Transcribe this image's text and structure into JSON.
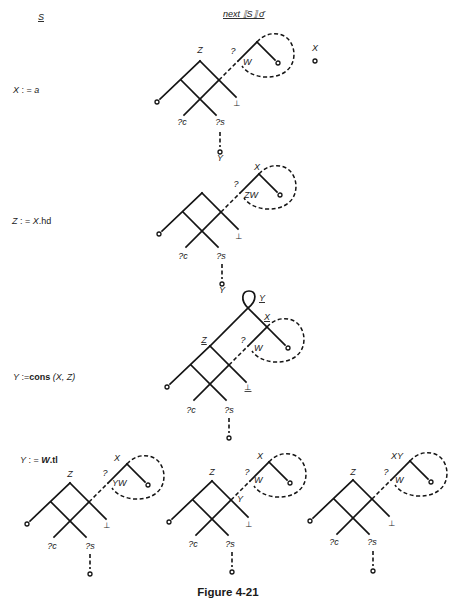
{
  "header": {
    "statement_heading": "S",
    "semantics_heading": "next ⟦S⟧ σ̄"
  },
  "statements": [
    {
      "lhs": "X",
      "assign": " : = ",
      "rhs": "a"
    },
    {
      "lhs": "Z",
      "assign": " : = ",
      "obj": "X",
      "field": ".hd"
    },
    {
      "lhs": "Y",
      "assign": " :=",
      "fn": "cons",
      "args": "  (X, Z)"
    },
    {
      "lhs": "Y",
      "assign": " : = ",
      "obj": "W",
      "field": ".tl"
    }
  ],
  "diagrams": [
    {
      "apex": "Z",
      "question": "?",
      "loop_entry": "W",
      "bottom": "⊥",
      "sel_c": "?c",
      "sel_s": "?s",
      "tail": "Y",
      "side_var": "X"
    },
    {
      "loop_top": "X",
      "question": "?",
      "loop_entry": "ZW",
      "bottom": "⊥",
      "sel_c": "?c",
      "sel_s": "?s",
      "tail": "Y"
    },
    {
      "apex": "Z",
      "top": "Y",
      "loop_top": "X",
      "question": "?",
      "loop_entry": "W",
      "bottom": "⊥",
      "sel_c": "?c",
      "sel_s": "?s"
    },
    {
      "apex": "Z",
      "loop_top": "X",
      "question": "?",
      "loop_entry": "YW",
      "bottom": "⊥",
      "sel_c": "?c",
      "sel_s": "?s"
    },
    {
      "apex": "Z",
      "loop_top": "X",
      "question": "?",
      "loop_entry": "W",
      "right_node": "Y",
      "bottom": "⊥",
      "sel_c": "?c",
      "sel_s": "?s"
    },
    {
      "apex": "Z",
      "loop_top": "XY",
      "question": "?",
      "loop_entry": "W",
      "bottom": "⊥",
      "sel_c": "?c",
      "sel_s": "?s"
    }
  ],
  "caption": "Figure 4-21"
}
